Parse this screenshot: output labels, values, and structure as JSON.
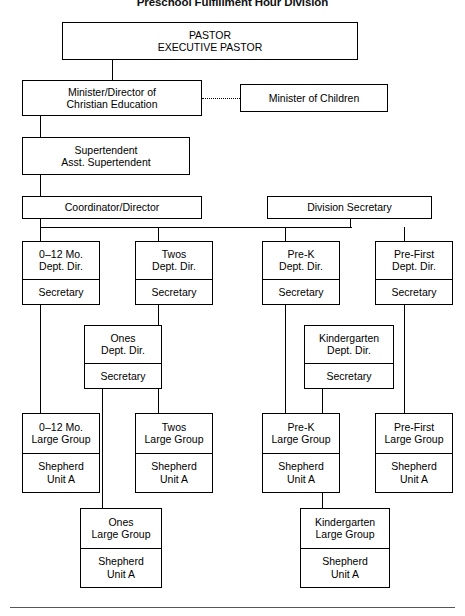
{
  "title": "Preschool Fulfillment Hour Division",
  "nodes": [
    {
      "id": "pastor",
      "name": "node-pastor",
      "x": 62,
      "y": 22,
      "w": 296,
      "h": 38,
      "cells": [
        {
          "lines": [
            "PASTOR",
            "EXECUTIVE PASTOR"
          ],
          "divider": false
        }
      ]
    },
    {
      "id": "minister-christian-education",
      "name": "node-minister-of-christian-education",
      "x": 22,
      "y": 80,
      "w": 180,
      "h": 36,
      "cells": [
        {
          "lines": [
            "Minister/Director of",
            "Christian Education"
          ],
          "divider": false
        }
      ]
    },
    {
      "id": "minister-children",
      "name": "node-minister-of-children",
      "x": 240,
      "y": 84,
      "w": 148,
      "h": 28,
      "cells": [
        {
          "lines": [
            "Minister of Children"
          ],
          "divider": false
        }
      ]
    },
    {
      "id": "supertendent",
      "name": "node-supertendent",
      "x": 22,
      "y": 137,
      "w": 168,
      "h": 38,
      "cells": [
        {
          "lines": [
            "Supertendent",
            "Asst. Supertendent"
          ],
          "divider": false
        }
      ]
    },
    {
      "id": "coordinator-director",
      "name": "node-coordinator-director",
      "x": 22,
      "y": 196,
      "w": 180,
      "h": 23,
      "cells": [
        {
          "lines": [
            "Coordinator/Director"
          ],
          "divider": false
        }
      ]
    },
    {
      "id": "division-secretary",
      "name": "node-division-secretary",
      "x": 267,
      "y": 196,
      "w": 165,
      "h": 23,
      "cells": [
        {
          "lines": [
            "Division Secretary"
          ],
          "divider": false
        }
      ]
    },
    {
      "id": "dept-0-12mo",
      "name": "node-dept-0-12-mo",
      "x": 22,
      "y": 241,
      "w": 78,
      "h": 64,
      "cells": [
        {
          "lines": [
            "0–12 Mo.",
            "Dept. Dir."
          ],
          "divider": false
        },
        {
          "lines": [
            "Secretary"
          ],
          "divider": true
        }
      ]
    },
    {
      "id": "dept-twos",
      "name": "node-dept-twos",
      "x": 135,
      "y": 241,
      "w": 78,
      "h": 64,
      "cells": [
        {
          "lines": [
            "Twos",
            "Dept. Dir."
          ],
          "divider": false
        },
        {
          "lines": [
            "Secretary"
          ],
          "divider": true
        }
      ]
    },
    {
      "id": "dept-pre-k",
      "name": "node-dept-pre-k",
      "x": 262,
      "y": 241,
      "w": 78,
      "h": 64,
      "cells": [
        {
          "lines": [
            "Pre-K",
            "Dept. Dir."
          ],
          "divider": false
        },
        {
          "lines": [
            "Secretary"
          ],
          "divider": true
        }
      ]
    },
    {
      "id": "dept-pre-first",
      "name": "node-dept-pre-first",
      "x": 375,
      "y": 241,
      "w": 78,
      "h": 64,
      "cells": [
        {
          "lines": [
            "Pre-First",
            "Dept. Dir."
          ],
          "divider": false
        },
        {
          "lines": [
            "Secretary"
          ],
          "divider": true
        }
      ]
    },
    {
      "id": "dept-ones",
      "name": "node-dept-ones",
      "x": 84,
      "y": 325,
      "w": 78,
      "h": 64,
      "cells": [
        {
          "lines": [
            "Ones",
            "Dept. Dir."
          ],
          "divider": false
        },
        {
          "lines": [
            "Secretary"
          ],
          "divider": true
        }
      ]
    },
    {
      "id": "dept-kindergarten",
      "name": "node-dept-kindergarten",
      "x": 304,
      "y": 325,
      "w": 90,
      "h": 64,
      "cells": [
        {
          "lines": [
            "Kindergarten",
            "Dept. Dir."
          ],
          "divider": false
        },
        {
          "lines": [
            "Secretary"
          ],
          "divider": true
        }
      ]
    },
    {
      "id": "group-0-12mo",
      "name": "node-group-0-12-mo",
      "x": 22,
      "y": 413,
      "w": 78,
      "h": 80,
      "cells": [
        {
          "lines": [
            "0–12 Mo.",
            "Large Group"
          ],
          "divider": false
        },
        {
          "lines": [
            "Shepherd",
            "Unit A"
          ],
          "divider": true
        }
      ]
    },
    {
      "id": "group-twos",
      "name": "node-group-twos",
      "x": 135,
      "y": 413,
      "w": 78,
      "h": 80,
      "cells": [
        {
          "lines": [
            "Twos",
            "Large Group"
          ],
          "divider": false
        },
        {
          "lines": [
            "Shepherd",
            "Unit A"
          ],
          "divider": true
        }
      ]
    },
    {
      "id": "group-pre-k",
      "name": "node-group-pre-k",
      "x": 262,
      "y": 413,
      "w": 78,
      "h": 80,
      "cells": [
        {
          "lines": [
            "Pre-K",
            "Large Group"
          ],
          "divider": false
        },
        {
          "lines": [
            "Shepherd",
            "Unit A"
          ],
          "divider": true
        }
      ]
    },
    {
      "id": "group-pre-first",
      "name": "node-group-pre-first",
      "x": 375,
      "y": 413,
      "w": 78,
      "h": 80,
      "cells": [
        {
          "lines": [
            "Pre-First",
            "Large Group"
          ],
          "divider": false
        },
        {
          "lines": [
            "Shepherd",
            "Unit A"
          ],
          "divider": true
        }
      ]
    },
    {
      "id": "group-ones",
      "name": "node-group-ones",
      "x": 80,
      "y": 508,
      "w": 82,
      "h": 80,
      "cells": [
        {
          "lines": [
            "Ones",
            "Large Group"
          ],
          "divider": false
        },
        {
          "lines": [
            "Shepherd",
            "Unit A"
          ],
          "divider": true
        }
      ]
    },
    {
      "id": "group-kindergarten",
      "name": "node-group-kindergarten",
      "x": 300,
      "y": 508,
      "w": 90,
      "h": 80,
      "cells": [
        {
          "lines": [
            "Kindergarten",
            "Large Group"
          ],
          "divider": false
        },
        {
          "lines": [
            "Shepherd",
            "Unit A"
          ],
          "divider": true
        }
      ]
    }
  ],
  "connectors": [
    {
      "name": "conn-pastor-down",
      "type": "v",
      "x": 112,
      "y": 60,
      "len": 20
    },
    {
      "name": "conn-cedu-down",
      "type": "v",
      "x": 40,
      "y": 116,
      "len": 21
    },
    {
      "name": "conn-supertendent-down",
      "type": "v",
      "x": 40,
      "y": 175,
      "len": 21
    },
    {
      "name": "conn-coordinator-down",
      "type": "v",
      "x": 40,
      "y": 219,
      "len": 8
    },
    {
      "name": "conn-coordinator-bus",
      "type": "h",
      "x": 40,
      "y": 227,
      "len": 312
    },
    {
      "name": "conn-division-secretary-up",
      "type": "v",
      "x": 350,
      "y": 219,
      "len": 8
    },
    {
      "name": "conn-dept-0-12mo-up",
      "type": "v",
      "x": 40,
      "y": 227,
      "len": 14
    },
    {
      "name": "conn-dept-twos-up",
      "type": "v",
      "x": 158,
      "y": 227,
      "len": 14
    },
    {
      "name": "conn-dept-pre-k-up",
      "type": "v",
      "x": 285,
      "y": 227,
      "len": 14
    },
    {
      "name": "conn-dept-pre-first-up",
      "type": "v",
      "x": 404,
      "y": 227,
      "len": 14
    },
    {
      "name": "conn-left-spine",
      "type": "v",
      "x": 40,
      "y": 305,
      "len": 108
    },
    {
      "name": "conn-twos-spine",
      "type": "v",
      "x": 158,
      "y": 305,
      "len": 108
    },
    {
      "name": "conn-ones-branch",
      "type": "h",
      "x": 102,
      "y": 339,
      "len": 33
    },
    {
      "name": "conn-ones-dept-drop",
      "type": "v",
      "x": 102,
      "y": 389,
      "len": 119
    },
    {
      "name": "conn-ones-group-in",
      "type": "h",
      "x": 102,
      "y": 548,
      "len": 18
    },
    {
      "name": "conn-pre-k-spine",
      "type": "v",
      "x": 285,
      "y": 305,
      "len": 108
    },
    {
      "name": "conn-pre-first-spine",
      "type": "v",
      "x": 404,
      "y": 305,
      "len": 108
    },
    {
      "name": "conn-kindergarten-branch",
      "type": "h",
      "x": 322,
      "y": 339,
      "len": 53
    },
    {
      "name": "conn-kindergarten-drop",
      "type": "v",
      "x": 322,
      "y": 389,
      "len": 119
    },
    {
      "name": "conn-kindergarten-group-in",
      "type": "h",
      "x": 322,
      "y": 548,
      "len": 23
    }
  ],
  "dotted_connector": {
    "name": "conn-dotted-cedu-to-children",
    "x": 202,
    "y": 98,
    "len": 38
  },
  "footer_rule": {
    "name": "footer-rule",
    "x": 10,
    "y": 607,
    "len": 445
  }
}
